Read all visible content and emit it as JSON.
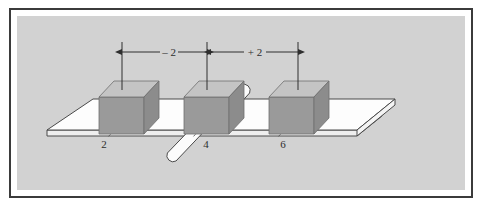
{
  "figure": {
    "background_color": "#d2d2d2",
    "frame_color": "#3b3b3b",
    "page_color": "#ffffff"
  },
  "dimensions": [
    {
      "id": "left-span",
      "label": "– 2",
      "from_station": "2",
      "to_station": "4"
    },
    {
      "id": "right-span",
      "label": "+ 2",
      "from_station": "4",
      "to_station": "6"
    }
  ],
  "stations": [
    {
      "id": "station-2",
      "label": "2"
    },
    {
      "id": "station-4",
      "label": "4"
    },
    {
      "id": "station-6",
      "label": "6"
    }
  ],
  "blocks": [
    {
      "id": "block-1",
      "station": "2",
      "front_color": "#9a9a9a",
      "top_color": "#c7c7c7",
      "side_color": "#8a8a8a"
    },
    {
      "id": "block-2",
      "station": "4",
      "front_color": "#9a9a9a",
      "top_color": "#c7c7c7",
      "side_color": "#8a8a8a"
    },
    {
      "id": "block-3",
      "station": "6",
      "front_color": "#9a9a9a",
      "top_color": "#c7c7c7",
      "side_color": "#8a8a8a"
    }
  ],
  "slab": {
    "id": "slab",
    "top_color": "#fdfdfd",
    "edge_color": "#f2f2f2",
    "outline_color": "#4a4a4a"
  },
  "rod": {
    "id": "rod",
    "body_color": "#fbfbfb",
    "outline_color": "#4a4a4a"
  }
}
